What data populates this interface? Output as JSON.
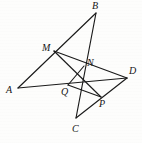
{
  "figure": {
    "kind": "geometry-line-diagram",
    "canvas": {
      "width": 142,
      "height": 143
    },
    "stroke_color": "#1a1a1a",
    "background_color": "#fdfdfc",
    "points": {
      "A": {
        "label": "A",
        "x": 18,
        "y": 88,
        "label_x": 6,
        "label_y": 85
      },
      "B": {
        "label": "B",
        "x": 96,
        "y": 13,
        "label_x": 92,
        "label_y": 1
      },
      "C": {
        "label": "C",
        "x": 76,
        "y": 118,
        "label_x": 72,
        "label_y": 124
      },
      "D": {
        "label": "D",
        "x": 127,
        "y": 78,
        "label_x": 129,
        "label_y": 66
      },
      "M": {
        "label": "M",
        "x": 54,
        "y": 51,
        "label_x": 42,
        "label_y": 43
      },
      "N": {
        "label": "N",
        "x": 84,
        "y": 66,
        "label_x": 87,
        "label_y": 58
      },
      "P": {
        "label": "P",
        "x": 101,
        "y": 97,
        "label_x": 99,
        "label_y": 99
      },
      "Q": {
        "label": "Q",
        "x": 68,
        "y": 85,
        "label_x": 61,
        "label_y": 87
      }
    },
    "segments": [
      {
        "name": "segment-A-B",
        "from": "A",
        "to": "B",
        "through": [
          "M"
        ]
      },
      {
        "name": "segment-A-D",
        "from": "A",
        "to": "D",
        "through": [
          "Q"
        ]
      },
      {
        "name": "segment-B-C",
        "from": "B",
        "to": "C",
        "through": [
          "N"
        ]
      },
      {
        "name": "segment-C-D",
        "from": "C",
        "to": "D",
        "through": [
          "P"
        ]
      },
      {
        "name": "segment-M-D",
        "from": "M",
        "to": "D",
        "through": [
          "N"
        ]
      },
      {
        "name": "segment-M-P",
        "from": "M",
        "to": "P",
        "through": []
      },
      {
        "name": "segment-N-Q",
        "from": "N",
        "to": "Q",
        "through": []
      },
      {
        "name": "segment-Q-P",
        "from": "Q",
        "to": "P",
        "through": []
      }
    ]
  }
}
